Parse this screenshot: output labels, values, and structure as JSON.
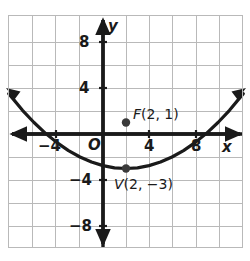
{
  "figure": {
    "kind": "coordinate-plane-parabola",
    "background_color": "#ffffff",
    "grid_color": "#b9b9b9",
    "axis_color": "#1a1a1a",
    "curve_color": "#1a1a1a",
    "point_color": "#3a3a3a"
  },
  "axes": {
    "x_label": "x",
    "y_label": "y",
    "origin_label": "O",
    "x_ticks": [
      {
        "value": -4,
        "label": "−4"
      },
      {
        "value": 4,
        "label": "4"
      },
      {
        "value": 8,
        "label": "8"
      }
    ],
    "y_ticks": [
      {
        "value": 8,
        "label": "8"
      },
      {
        "value": 4,
        "label": "4"
      },
      {
        "value": -4,
        "label": "−4"
      },
      {
        "value": -8,
        "label": "−8"
      }
    ],
    "xlim": [
      -8.5,
      12.8
    ],
    "ylim": [
      -10.3,
      10.4
    ],
    "grid_step": 2
  },
  "chart_data": {
    "type": "line",
    "title": "",
    "xlabel": "x",
    "ylabel": "y",
    "xlim": [
      -8.5,
      12.8
    ],
    "ylim": [
      -10.3,
      10.4
    ],
    "grid": true,
    "legend": "none",
    "series": [
      {
        "name": "parabola",
        "equation": "y = (x - 2)^2 / 16 - 3",
        "x": [
          -8.2,
          -7.0,
          -6.0,
          -5.0,
          -4.0,
          -3.0,
          -2.0,
          -1.0,
          0.0,
          1.0,
          2.0,
          3.0,
          4.0,
          5.0,
          6.0,
          7.0,
          8.0,
          9.0,
          10.0,
          11.0,
          12.2
        ],
        "y": [
          3.51,
          2.06,
          1.0,
          0.06,
          -0.75,
          -1.44,
          -2.0,
          -2.44,
          -2.75,
          -2.94,
          -3.0,
          -2.94,
          -2.75,
          -2.44,
          -2.0,
          -1.44,
          -0.75,
          0.06,
          1.0,
          2.06,
          3.51
        ]
      }
    ],
    "points": [
      {
        "name": "F",
        "label": "F(2, 1)",
        "x": 2,
        "y": 1,
        "role": "focus"
      },
      {
        "name": "V",
        "label": "V(2, −3)",
        "x": 2,
        "y": -3,
        "role": "vertex"
      }
    ],
    "annotations": [
      {
        "text": "F(2, 1)",
        "x": 2.6,
        "y": 2.0
      },
      {
        "text": "V(2, −3)",
        "x": 2.6,
        "y": -4.6
      }
    ]
  },
  "labels": {
    "focus_name": "F",
    "focus_coords": "(2, 1)",
    "vertex_name": "V",
    "vertex_coords": "(2, −3)"
  }
}
